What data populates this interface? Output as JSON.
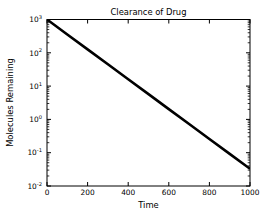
{
  "figure": {
    "background_color": "#ffffff",
    "foreground_color": "#000000",
    "width": 274,
    "height": 216
  },
  "chart_data": {
    "type": "line",
    "title": "Clearance of Drug",
    "xlabel": "Time",
    "ylabel": "Molecules Remaining",
    "grid": false,
    "legend": null,
    "legend_position": "none",
    "xscale": "linear",
    "yscale": "log",
    "xlim": [
      0,
      1000
    ],
    "ylim": [
      0.01,
      1000
    ],
    "xticks": [
      0,
      200,
      400,
      600,
      800,
      1000
    ],
    "xticklabels": [
      "0",
      "200",
      "400",
      "600",
      "800",
      "1000"
    ],
    "yticks": [
      1000,
      100,
      10,
      1,
      0.1,
      0.01
    ],
    "yticklabels": [
      "10^3",
      "10^2",
      "10^1",
      "10^0",
      "10^-1",
      "10^-2"
    ],
    "ytick_mantissas": [
      "10",
      "10",
      "10",
      "10",
      "10",
      "10"
    ],
    "ytick_exponents": [
      "3",
      "2",
      "1",
      "0",
      "-1",
      "-2"
    ],
    "minor_ticks": true,
    "series": [
      {
        "name": "molecules remaining",
        "color": "#000000",
        "linewidth": 2.6,
        "model": "exponential decay",
        "equation": "N(t) = 1000 * exp(-0.01032 * t)",
        "initial_value": 1000,
        "decay_rate": 0.01032,
        "x": [
          0,
          100,
          200,
          300,
          400,
          500,
          600,
          700,
          800,
          900,
          1000
        ],
        "y": [
          1000,
          356.2,
          126.9,
          45.2,
          16.1,
          5.73,
          2.04,
          0.727,
          0.259,
          0.0923,
          0.0329
        ]
      }
    ]
  }
}
